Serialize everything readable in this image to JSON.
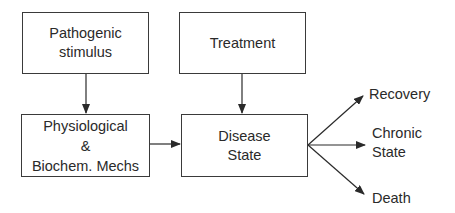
{
  "diagram": {
    "type": "flowchart",
    "nodes": {
      "pathogenic_stimulus": {
        "line1": "Pathogenic",
        "line2": "stimulus"
      },
      "treatment": {
        "line1": "Treatment"
      },
      "mechanisms": {
        "line1": "Physiological",
        "line2": "&",
        "line3": "Biochem. Mechs"
      },
      "disease_state": {
        "line1": "Disease",
        "line2": "State"
      }
    },
    "outcomes": {
      "recovery": "Recovery",
      "chronic_line1": "Chronic",
      "chronic_line2": "State",
      "death": "Death"
    },
    "edges": [
      {
        "from": "Pathogenic stimulus",
        "to": "Physiological & Biochem. Mechs"
      },
      {
        "from": "Treatment",
        "to": "Disease State"
      },
      {
        "from": "Physiological & Biochem. Mechs",
        "to": "Disease State"
      },
      {
        "from": "Disease State",
        "to": "Recovery"
      },
      {
        "from": "Disease State",
        "to": "Chronic State"
      },
      {
        "from": "Disease State",
        "to": "Death"
      }
    ],
    "colors": {
      "line": "#2a2a2a",
      "background": "#ffffff"
    }
  }
}
